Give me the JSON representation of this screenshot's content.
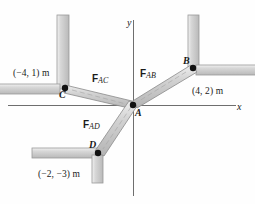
{
  "figure": {
    "type": "statics-free-body-diagram",
    "axes": {
      "x_label": "x",
      "y_label": "y"
    },
    "joint": {
      "name": "A",
      "label": "A"
    },
    "points": [
      {
        "name": "A",
        "label": "A",
        "coord_text": ""
      },
      {
        "name": "B",
        "label": "B",
        "coord_text": "(4, 2) m"
      },
      {
        "name": "C",
        "label": "C",
        "coord_text": "(−4, 1) m"
      },
      {
        "name": "D",
        "label": "D",
        "coord_text": "(−2, −3) m"
      }
    ],
    "forces": [
      {
        "name": "F_AC",
        "symbol": "F",
        "subscript": "AC"
      },
      {
        "name": "F_AB",
        "symbol": "F",
        "subscript": "AB"
      },
      {
        "name": "F_AD",
        "symbol": "F",
        "subscript": "AD"
      }
    ],
    "colors": {
      "member_fill": "#c9c9c9",
      "member_edge": "#8a8a8a",
      "wall_fill": "#cccccc",
      "wall_edge": "#9a9a9a",
      "axis": "#6e6e6e",
      "node": "#111111",
      "text": "#1a1a1a"
    }
  }
}
